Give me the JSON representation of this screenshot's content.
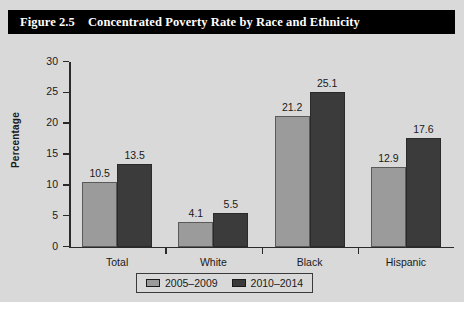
{
  "figure": {
    "number": "Figure 2.5",
    "title": "Concentrated Poverty Rate by Race and Ethnicity"
  },
  "chart_data": {
    "type": "bar",
    "title": "Concentrated Poverty Rate by Race and Ethnicity",
    "xlabel": "",
    "ylabel": "Percentage",
    "categories": [
      "Total",
      "White",
      "Black",
      "Hispanic"
    ],
    "series": [
      {
        "name": "2005–2009",
        "color": "#9b9b9b",
        "values": [
          10.5,
          4.1,
          21.2,
          12.9
        ]
      },
      {
        "name": "2010–2014",
        "color": "#3b3b3b",
        "values": [
          13.5,
          5.5,
          25.1,
          17.6
        ]
      }
    ],
    "ylim": [
      0,
      30
    ],
    "yticks": [
      0,
      5,
      10,
      15,
      20,
      25,
      30
    ],
    "ytick_labels": [
      "0",
      "5",
      "10",
      "15",
      "20",
      "25",
      "30"
    ],
    "grid": false,
    "legend_position": "bottom",
    "data_labels": [
      "10.5",
      "13.5",
      "4.1",
      "5.5",
      "21.2",
      "25.1",
      "12.9",
      "17.6"
    ]
  },
  "colors": {
    "header_background": "#000000",
    "header_text": "#ffffff",
    "figure_background": "#d9d9d9",
    "series_2005_2009": "#9b9b9b",
    "series_2010_2014": "#3b3b3b",
    "axis": "#2a2a2a"
  }
}
